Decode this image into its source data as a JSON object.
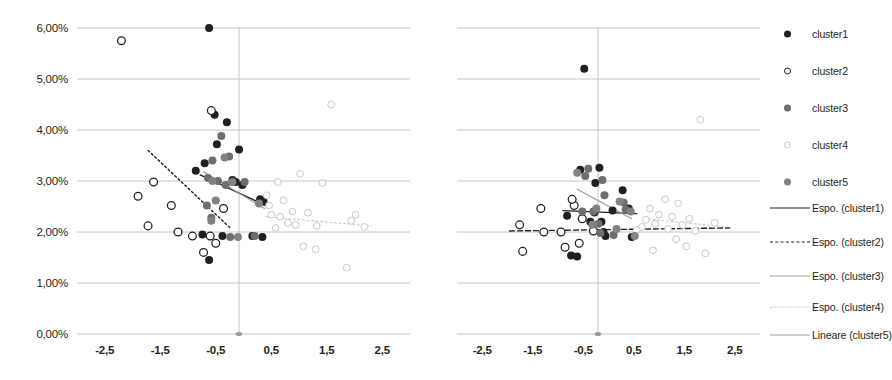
{
  "chart_data": {
    "type": "scatter",
    "title": "",
    "xlabel": "",
    "ylabel": "",
    "grid": true,
    "legend_position": "right",
    "xlim": [
      -3.0,
      3.0
    ],
    "ylim": [
      0.0,
      6.0
    ],
    "xticks": [
      "-2,5",
      "-1,5",
      "-0,5",
      "0,5",
      "1,5",
      "2,5"
    ],
    "xtick_values": [
      -2.5,
      -1.5,
      -0.5,
      0.5,
      1.5,
      2.5
    ],
    "yticks": [
      "0,00%",
      "1,00%",
      "2,00%",
      "3,00%",
      "4,00%",
      "5,00%",
      "6,00%"
    ],
    "ytick_values": [
      0.0,
      1.0,
      2.0,
      3.0,
      4.0,
      5.0,
      6.0
    ],
    "panels": [
      {
        "name": "left-panel",
        "series": [
          {
            "name": "cluster1",
            "marker": "filled-circle",
            "color": "#231f20",
            "points": [
              [
                -0.62,
                6.0
              ],
              [
                -0.52,
                4.3
              ],
              [
                -0.3,
                4.15
              ],
              [
                -0.08,
                3.62
              ],
              [
                -0.48,
                3.72
              ],
              [
                -0.7,
                3.35
              ],
              [
                -0.86,
                3.2
              ],
              [
                -0.2,
                3.02
              ],
              [
                -0.14,
                2.98
              ],
              [
                0.3,
                2.64
              ],
              [
                0.36,
                2.6
              ],
              [
                -0.74,
                1.95
              ],
              [
                -0.62,
                1.45
              ],
              [
                0.16,
                1.92
              ],
              [
                0.34,
                1.9
              ],
              [
                -0.38,
                1.92
              ],
              [
                -0.02,
                2.92
              ]
            ]
          },
          {
            "name": "cluster2",
            "marker": "open-circle",
            "color": "#231f20",
            "points": [
              [
                -2.2,
                5.75
              ],
              [
                -0.58,
                4.38
              ],
              [
                -1.62,
                2.98
              ],
              [
                -1.9,
                2.7
              ],
              [
                -1.72,
                2.12
              ],
              [
                -1.18,
                2.0
              ],
              [
                -0.92,
                1.92
              ],
              [
                -0.6,
                1.92
              ],
              [
                -0.5,
                1.78
              ],
              [
                -0.72,
                1.6
              ],
              [
                -1.3,
                2.52
              ],
              [
                -0.36,
                2.46
              ]
            ]
          },
          {
            "name": "cluster3",
            "marker": "filled-circle-gray",
            "color": "#6d6e71",
            "points": [
              [
                -0.4,
                3.88
              ],
              [
                -0.26,
                3.48
              ],
              [
                -0.56,
                3.4
              ],
              [
                -0.64,
                3.06
              ],
              [
                -0.46,
                3.0
              ],
              [
                -0.32,
                2.92
              ],
              [
                -0.66,
                2.52
              ],
              [
                -0.58,
                2.28
              ],
              [
                -0.24,
                1.9
              ],
              [
                0.2,
                1.92
              ],
              [
                0.02,
                2.98
              ]
            ]
          },
          {
            "name": "cluster4",
            "marker": "open-circle-light",
            "color": "#c9c9c9",
            "points": [
              [
                1.58,
                4.5
              ],
              [
                1.02,
                3.14
              ],
              [
                0.62,
                2.98
              ],
              [
                1.42,
                2.96
              ],
              [
                0.42,
                2.72
              ],
              [
                0.72,
                2.62
              ],
              [
                0.88,
                2.4
              ],
              [
                1.16,
                2.38
              ],
              [
                0.5,
                2.34
              ],
              [
                0.66,
                2.3
              ],
              [
                2.02,
                2.34
              ],
              [
                1.94,
                2.22
              ],
              [
                0.8,
                2.18
              ],
              [
                0.94,
                2.14
              ],
              [
                1.32,
                2.12
              ],
              [
                2.18,
                2.1
              ],
              [
                0.58,
                2.08
              ],
              [
                1.08,
                1.72
              ],
              [
                1.3,
                1.66
              ],
              [
                1.86,
                1.3
              ],
              [
                0.46,
                2.52
              ]
            ]
          },
          {
            "name": "cluster5",
            "marker": "filled-circle-gray",
            "color": "#808285",
            "points": [
              [
                -0.34,
                3.46
              ],
              [
                -0.2,
                2.98
              ],
              [
                0.28,
                2.56
              ],
              [
                -0.5,
                2.62
              ],
              [
                -0.58,
                2.22
              ],
              [
                -0.1,
                1.9
              ],
              [
                -0.56,
                3.0
              ]
            ]
          }
        ],
        "trendlines": [
          {
            "name": "Espo. (cluster1)",
            "style": "solid",
            "color": "#231f20",
            "x0": -0.78,
            "y0": 3.12,
            "x1": 0.44,
            "y1": 2.5
          },
          {
            "name": "Espo. (cluster2)",
            "style": "dotted",
            "color": "#231f20",
            "x0": -1.72,
            "y0": 3.6,
            "x1": -0.24,
            "y1": 2.08
          },
          {
            "name": "Espo. (cluster4)",
            "style": "dotted",
            "color": "#c9c9c9",
            "x0": 0.4,
            "y0": 2.3,
            "x1": 2.3,
            "y1": 2.12
          },
          {
            "name": "Lineare (cluster5)",
            "style": "solid",
            "color": "#9a9a9a",
            "x0": -0.72,
            "y0": 3.18,
            "x1": 0.38,
            "y1": 2.46
          }
        ]
      },
      {
        "name": "right-panel",
        "series": [
          {
            "name": "cluster1",
            "marker": "filled-circle",
            "color": "#231f20",
            "points": [
              [
                -0.48,
                5.2
              ],
              [
                -0.56,
                3.22
              ],
              [
                -0.18,
                3.26
              ],
              [
                -0.26,
                2.96
              ],
              [
                0.28,
                2.82
              ],
              [
                0.4,
                2.46
              ],
              [
                0.08,
                2.42
              ],
              [
                -0.28,
                2.38
              ],
              [
                -0.82,
                2.32
              ],
              [
                -0.14,
                2.2
              ],
              [
                -0.1,
                2.0
              ],
              [
                -0.06,
                1.92
              ],
              [
                -0.74,
                1.54
              ],
              [
                -0.62,
                1.52
              ],
              [
                0.46,
                1.9
              ],
              [
                -0.36,
                2.2
              ]
            ]
          },
          {
            "name": "cluster2",
            "marker": "open-circle",
            "color": "#231f20",
            "points": [
              [
                -1.34,
                2.46
              ],
              [
                -0.68,
                2.52
              ],
              [
                -1.76,
                2.14
              ],
              [
                -1.28,
                2.0
              ],
              [
                -0.94,
                2.0
              ],
              [
                -0.52,
                2.26
              ],
              [
                -0.3,
                2.02
              ],
              [
                -0.86,
                1.7
              ],
              [
                -0.58,
                1.78
              ],
              [
                -1.7,
                1.62
              ],
              [
                -0.72,
                2.64
              ]
            ]
          },
          {
            "name": "cluster3",
            "marker": "filled-circle-gray",
            "color": "#6d6e71",
            "points": [
              [
                -0.4,
                3.24
              ],
              [
                -0.46,
                3.1
              ],
              [
                -0.12,
                3.02
              ],
              [
                -0.08,
                2.72
              ],
              [
                0.3,
                2.58
              ],
              [
                -0.52,
                2.4
              ],
              [
                -0.3,
                2.4
              ],
              [
                -0.2,
                2.16
              ],
              [
                0.34,
                2.44
              ],
              [
                -0.16,
                1.98
              ],
              [
                0.1,
                1.94
              ]
            ]
          },
          {
            "name": "cluster4",
            "marker": "open-circle-light",
            "color": "#c9c9c9",
            "points": [
              [
                1.82,
                4.2
              ],
              [
                1.12,
                2.64
              ],
              [
                1.38,
                2.56
              ],
              [
                0.82,
                2.46
              ],
              [
                1.0,
                2.34
              ],
              [
                1.26,
                2.3
              ],
              [
                1.6,
                2.26
              ],
              [
                0.74,
                2.24
              ],
              [
                0.92,
                2.16
              ],
              [
                1.46,
                2.14
              ],
              [
                2.1,
                2.18
              ],
              [
                0.66,
                2.1
              ],
              [
                1.18,
                2.06
              ],
              [
                1.72,
                2.02
              ],
              [
                0.56,
                2.04
              ],
              [
                1.34,
                1.86
              ],
              [
                1.54,
                1.72
              ],
              [
                1.92,
                1.58
              ],
              [
                0.88,
                1.64
              ]
            ]
          },
          {
            "name": "cluster5",
            "marker": "filled-circle-gray",
            "color": "#808285",
            "points": [
              [
                -0.62,
                3.16
              ],
              [
                0.22,
                2.6
              ],
              [
                -0.24,
                2.46
              ],
              [
                0.44,
                2.4
              ],
              [
                -0.32,
                2.14
              ],
              [
                0.16,
                2.06
              ],
              [
                0.52,
                1.92
              ]
            ]
          }
        ],
        "trendlines": [
          {
            "name": "Espo. (cluster1)",
            "style": "solid",
            "color": "#231f20",
            "x0": -0.9,
            "y0": 2.42,
            "x1": 0.56,
            "y1": 2.36
          },
          {
            "name": "Espo. (cluster2)",
            "style": "dashed",
            "color": "#231f20",
            "x0": -1.96,
            "y0": 2.02,
            "x1": 2.4,
            "y1": 2.08
          },
          {
            "name": "Espo. (cluster4)",
            "style": "dotted",
            "color": "#c9c9c9",
            "x0": 0.7,
            "y0": 2.26,
            "x1": 2.34,
            "y1": 2.1
          },
          {
            "name": "Lineare (cluster5)",
            "style": "solid",
            "color": "#9a9a9a",
            "x0": -0.62,
            "y0": 2.84,
            "x1": 0.46,
            "y1": 2.26
          }
        ]
      }
    ],
    "legend": [
      {
        "label": "cluster1",
        "kind": "marker",
        "marker": "filled-circle",
        "color": "#231f20"
      },
      {
        "label": "cluster2",
        "kind": "marker",
        "marker": "open-circle",
        "color": "#231f20"
      },
      {
        "label": "cluster3",
        "kind": "marker",
        "marker": "filled-circle-gray",
        "color": "#6d6e71"
      },
      {
        "label": "cluster4",
        "kind": "marker",
        "marker": "open-circle-light",
        "color": "#c9c9c9"
      },
      {
        "label": "cluster5",
        "kind": "marker",
        "marker": "filled-circle-gray",
        "color": "#808285"
      },
      {
        "label": "Espo. (cluster1)",
        "kind": "line",
        "style": "solid",
        "color": "#231f20"
      },
      {
        "label": "Espo. (cluster2)",
        "kind": "line",
        "style": "dashed",
        "color": "#231f20"
      },
      {
        "label": "Espo. (cluster3)",
        "kind": "line",
        "style": "solid",
        "color": "#a6a6a6"
      },
      {
        "label": "Espo. (cluster4)",
        "kind": "line",
        "style": "dotted",
        "color": "#bdbdbd"
      },
      {
        "label": "Lineare (cluster5)",
        "kind": "line",
        "style": "solid",
        "color": "#a6a6a6"
      }
    ]
  }
}
